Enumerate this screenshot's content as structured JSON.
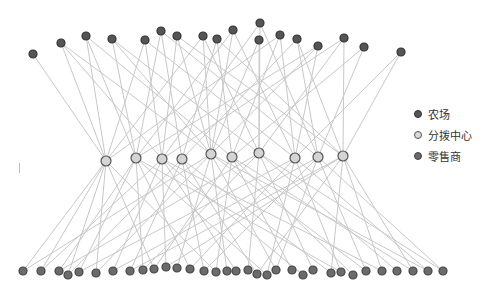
{
  "legend": {
    "items": [
      {
        "label": "农场",
        "fill": "#555555",
        "stroke": "#333333"
      },
      {
        "label": "分拨中心",
        "fill": "#d9d9d9",
        "stroke": "#555555"
      },
      {
        "label": "零售商",
        "fill": "#6b6b6b",
        "stroke": "#444444"
      }
    ]
  },
  "style": {
    "edge_color": "#c8c8c8",
    "farm_fill": "#555555",
    "farm_stroke": "#333333",
    "farm_r": 4,
    "hub_fill": "#d4d4d4",
    "hub_stroke": "#555555",
    "hub_r": 5,
    "retail_fill": "#6b6b6b",
    "retail_stroke": "#444444",
    "retail_r": 4
  },
  "nodes": {
    "farms": [
      [
        33,
        54
      ],
      [
        61,
        43
      ],
      [
        86,
        36
      ],
      [
        112,
        39
      ],
      [
        145,
        40
      ],
      [
        161,
        31
      ],
      [
        177,
        36
      ],
      [
        203,
        36
      ],
      [
        217,
        39
      ],
      [
        233,
        30
      ],
      [
        260,
        23
      ],
      [
        259,
        40
      ],
      [
        280,
        35
      ],
      [
        297,
        39
      ],
      [
        318,
        46
      ],
      [
        344,
        38
      ],
      [
        364,
        47
      ],
      [
        401,
        52
      ]
    ],
    "hubs": [
      [
        106,
        161
      ],
      [
        136,
        158
      ],
      [
        162,
        159
      ],
      [
        182,
        159
      ],
      [
        211,
        154
      ],
      [
        232,
        157
      ],
      [
        259,
        153
      ],
      [
        295,
        158
      ],
      [
        318,
        157
      ],
      [
        343,
        156
      ]
    ],
    "retailers": [
      [
        23,
        271
      ],
      [
        41,
        271
      ],
      [
        59,
        271
      ],
      [
        68,
        275
      ],
      [
        79,
        272
      ],
      [
        96,
        273
      ],
      [
        113,
        271
      ],
      [
        130,
        271
      ],
      [
        143,
        270
      ],
      [
        154,
        269
      ],
      [
        166,
        267
      ],
      [
        177,
        268
      ],
      [
        190,
        269
      ],
      [
        204,
        271
      ],
      [
        216,
        272
      ],
      [
        227,
        271
      ],
      [
        236,
        271
      ],
      [
        248,
        270
      ],
      [
        257,
        274
      ],
      [
        267,
        275
      ],
      [
        276,
        270
      ],
      [
        292,
        270
      ],
      [
        303,
        275
      ],
      [
        313,
        270
      ],
      [
        331,
        273
      ],
      [
        341,
        272
      ],
      [
        353,
        275
      ],
      [
        366,
        271
      ],
      [
        382,
        271
      ],
      [
        397,
        271
      ],
      [
        413,
        271
      ],
      [
        428,
        271
      ],
      [
        443,
        271
      ]
    ]
  },
  "edges": {
    "farm_hub": [
      [
        0,
        0
      ],
      [
        1,
        0
      ],
      [
        1,
        2
      ],
      [
        1,
        4
      ],
      [
        2,
        0
      ],
      [
        2,
        1
      ],
      [
        2,
        5
      ],
      [
        3,
        1
      ],
      [
        3,
        4
      ],
      [
        3,
        6
      ],
      [
        4,
        0
      ],
      [
        4,
        2
      ],
      [
        4,
        7
      ],
      [
        5,
        1
      ],
      [
        5,
        3
      ],
      [
        5,
        8
      ],
      [
        6,
        2
      ],
      [
        6,
        4
      ],
      [
        6,
        9
      ],
      [
        7,
        0
      ],
      [
        7,
        4
      ],
      [
        7,
        6
      ],
      [
        8,
        3
      ],
      [
        8,
        5
      ],
      [
        8,
        9
      ],
      [
        9,
        1
      ],
      [
        9,
        4
      ],
      [
        9,
        7
      ],
      [
        10,
        6
      ],
      [
        10,
        2
      ],
      [
        10,
        8
      ],
      [
        11,
        4
      ],
      [
        11,
        6
      ],
      [
        12,
        5
      ],
      [
        12,
        7
      ],
      [
        12,
        0
      ],
      [
        13,
        3
      ],
      [
        13,
        8
      ],
      [
        13,
        9
      ],
      [
        14,
        4
      ],
      [
        14,
        7
      ],
      [
        14,
        1
      ],
      [
        15,
        9
      ],
      [
        15,
        6
      ],
      [
        15,
        2
      ],
      [
        16,
        8
      ],
      [
        16,
        5
      ],
      [
        17,
        9
      ],
      [
        17,
        7
      ]
    ],
    "hub_retail": [
      [
        0,
        0
      ],
      [
        0,
        1
      ],
      [
        0,
        3
      ],
      [
        0,
        5
      ],
      [
        0,
        9
      ],
      [
        0,
        14
      ],
      [
        1,
        2
      ],
      [
        1,
        4
      ],
      [
        1,
        8
      ],
      [
        1,
        12
      ],
      [
        1,
        19
      ],
      [
        1,
        25
      ],
      [
        2,
        1
      ],
      [
        2,
        6
      ],
      [
        2,
        10
      ],
      [
        2,
        16
      ],
      [
        2,
        22
      ],
      [
        2,
        28
      ],
      [
        3,
        3
      ],
      [
        3,
        7
      ],
      [
        3,
        13
      ],
      [
        3,
        18
      ],
      [
        3,
        24
      ],
      [
        4,
        0
      ],
      [
        4,
        5
      ],
      [
        4,
        11
      ],
      [
        4,
        15
      ],
      [
        4,
        20
      ],
      [
        4,
        27
      ],
      [
        4,
        31
      ],
      [
        5,
        9
      ],
      [
        5,
        14
      ],
      [
        5,
        21
      ],
      [
        5,
        26
      ],
      [
        5,
        30
      ],
      [
        6,
        2
      ],
      [
        6,
        8
      ],
      [
        6,
        17
      ],
      [
        6,
        23
      ],
      [
        6,
        29
      ],
      [
        6,
        32
      ],
      [
        7,
        4
      ],
      [
        7,
        12
      ],
      [
        7,
        19
      ],
      [
        7,
        25
      ],
      [
        7,
        31
      ],
      [
        8,
        6
      ],
      [
        8,
        13
      ],
      [
        8,
        20
      ],
      [
        8,
        27
      ],
      [
        8,
        32
      ],
      [
        9,
        7
      ],
      [
        9,
        10
      ],
      [
        9,
        18
      ],
      [
        9,
        24
      ],
      [
        9,
        28
      ],
      [
        9,
        30
      ]
    ]
  }
}
